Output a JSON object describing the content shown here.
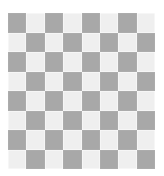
{
  "image": {
    "kind": "checkerboard-pattern",
    "width_px": 164,
    "height_px": 176,
    "background_color": "#ffffff"
  },
  "board": {
    "rows": 8,
    "columns": 8,
    "offset_left_px": 8,
    "offset_top_px": 13,
    "board_width_px": 147,
    "board_height_px": 156,
    "cell_width_px": 18.375,
    "cell_height_px": 19.5,
    "dark_color": "#a8a8a8",
    "light_color": "#efefef",
    "top_left_square": "dark",
    "squares": [
      [
        "dark",
        "light",
        "dark",
        "light",
        "dark",
        "light",
        "dark",
        "light"
      ],
      [
        "light",
        "dark",
        "light",
        "dark",
        "light",
        "dark",
        "light",
        "dark"
      ],
      [
        "dark",
        "light",
        "dark",
        "light",
        "dark",
        "light",
        "dark",
        "light"
      ],
      [
        "light",
        "dark",
        "light",
        "dark",
        "light",
        "dark",
        "light",
        "dark"
      ],
      [
        "dark",
        "light",
        "dark",
        "light",
        "dark",
        "light",
        "dark",
        "light"
      ],
      [
        "light",
        "dark",
        "light",
        "dark",
        "light",
        "dark",
        "light",
        "dark"
      ],
      [
        "dark",
        "light",
        "dark",
        "light",
        "dark",
        "light",
        "dark",
        "light"
      ],
      [
        "light",
        "dark",
        "light",
        "dark",
        "light",
        "dark",
        "light",
        "dark"
      ]
    ]
  }
}
